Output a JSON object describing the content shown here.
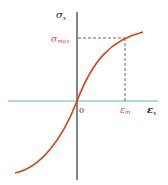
{
  "diagram": {
    "type": "stress-strain curve",
    "y_axis_label": "σ",
    "y_axis_sub": "x",
    "x_axis_label": "ε",
    "x_axis_sub": "x",
    "origin_label": "0",
    "sigma_max_label": "σ",
    "sigma_max_sub": "max",
    "epsilon_m_label": "ε",
    "epsilon_m_sub": "m"
  },
  "colors": {
    "curve": "#d4411a",
    "x_axis": "#5cc48a",
    "y_axis": "#333333",
    "dashed": "#555555",
    "highlight_label": "#d9465a",
    "axis_label": "#222222"
  }
}
